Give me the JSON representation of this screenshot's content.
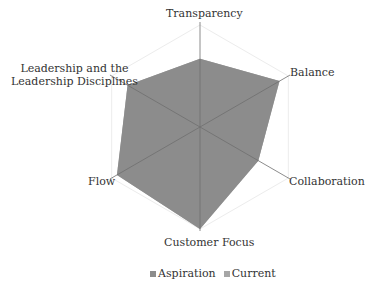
{
  "chart_data": {
    "type": "radar",
    "title": "",
    "categories": [
      "Transparency",
      "Balance",
      "Collaboration",
      "Customer Focus",
      "Flow",
      "Leadership and the Leadership Disciplines"
    ],
    "category_display": [
      [
        "Transparency"
      ],
      [
        "Balance"
      ],
      [
        "Collaboration"
      ],
      [
        "Customer Focus"
      ],
      [
        "Flow"
      ],
      [
        "Leadership and the",
        "Leadership Disciplines"
      ]
    ],
    "series": [
      {
        "name": "Aspiration",
        "color": "#8c8c8c",
        "values": [
          6.7,
          9.0,
          6.6,
          10.0,
          9.4,
          8.2
        ]
      },
      {
        "name": "Current",
        "color": "#a6a6a6",
        "values": [
          6.7,
          9.0,
          6.6,
          10.0,
          9.4,
          8.2
        ]
      }
    ],
    "rlim": [
      0,
      10
    ],
    "grid": true,
    "legend_position": "bottom"
  },
  "legend": {
    "items": [
      {
        "label": "Aspiration",
        "color": "#8c8c8c"
      },
      {
        "label": "Current",
        "color": "#a6a6a6"
      }
    ]
  }
}
